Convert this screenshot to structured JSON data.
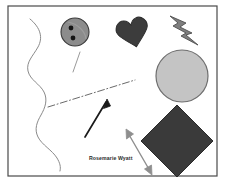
{
  "canvas": {
    "title": "drawing-canvas",
    "width": 226,
    "height": 183,
    "background_color": "#ffffff",
    "border": {
      "name": "canvas-frame",
      "color": "#4a4a4a",
      "x": 8,
      "y": 6,
      "width": 209,
      "height": 170,
      "stroke_width": 1.2
    }
  },
  "labels": {
    "name_label": {
      "text": "Rosemarie Wyatt",
      "color": "#2b2b2b",
      "x": 89,
      "y": 156
    }
  },
  "shapes": [
    {
      "id": "wavy-curve",
      "type": "freehand-curve",
      "stroke_color": "#8a8a8a",
      "stroke_width": 1.0,
      "fill": "none"
    },
    {
      "id": "button-circle",
      "type": "circle-with-dots",
      "fill_color": "#8c8c8c",
      "stroke_color": "#3a3a3a",
      "dot_color": "#1c1c1c",
      "cx": 75,
      "cy": 32,
      "r": 14,
      "dots": 2
    },
    {
      "id": "short-diagonal-line",
      "type": "line",
      "stroke_color": "#9a9a9a",
      "stroke_width": 1.0
    },
    {
      "id": "heart",
      "type": "heart",
      "fill_color": "#3c3c3c",
      "stroke_color": "#2e2e2e",
      "rotation": -12
    },
    {
      "id": "lightning-bolt",
      "type": "bolt",
      "fill_color": "#7e7e7e",
      "stroke_color": "#4e4e4e"
    },
    {
      "id": "large-circle",
      "type": "circle",
      "fill_color": "#c4c4c4",
      "stroke_color": "#6e6e6e",
      "cx": 182,
      "cy": 76,
      "r": 26
    },
    {
      "id": "dash-dot-line",
      "type": "dash-dot-line",
      "stroke_color": "#6a6a6a",
      "stroke_width": 1.0
    },
    {
      "id": "single-arrow",
      "type": "arrow",
      "stroke_color": "#1a1a1a",
      "stroke_width": 1.6,
      "direction": "up-right"
    },
    {
      "id": "diamond",
      "type": "rotated-square",
      "fill_color": "#3a3a3a",
      "stroke_color": "#2a2a2a",
      "cx": 177,
      "cy": 141,
      "half": 36
    },
    {
      "id": "double-arrow",
      "type": "double-headed-arrow",
      "stroke_color": "#8e8e8e",
      "stroke_width": 1.4,
      "direction": "up-left-down-right"
    }
  ]
}
